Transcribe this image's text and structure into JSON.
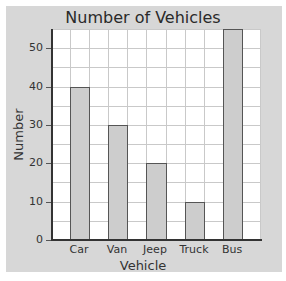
{
  "chart_data": {
    "type": "bar",
    "title": "Number of Vehicles",
    "xlabel": "Vehicle",
    "ylabel": "Number",
    "categories": [
      "Car",
      "Van",
      "Jeep",
      "Truck",
      "Bus"
    ],
    "values": [
      40,
      30,
      20,
      10,
      55
    ],
    "ylim": [
      0,
      55
    ],
    "yticks": [
      0,
      10,
      20,
      30,
      40,
      50
    ],
    "grid": true,
    "grid_step": 5,
    "bar_color": "#cdcdcd",
    "legend": null
  },
  "labels": {
    "title": "Number of Vehicles",
    "xlabel": "Vehicle",
    "ylabel": "Number",
    "yticks": [
      "0",
      "10",
      "20",
      "30",
      "40",
      "50"
    ],
    "xticks": [
      "Car",
      "Van",
      "Jeep",
      "Truck",
      "Bus"
    ]
  }
}
